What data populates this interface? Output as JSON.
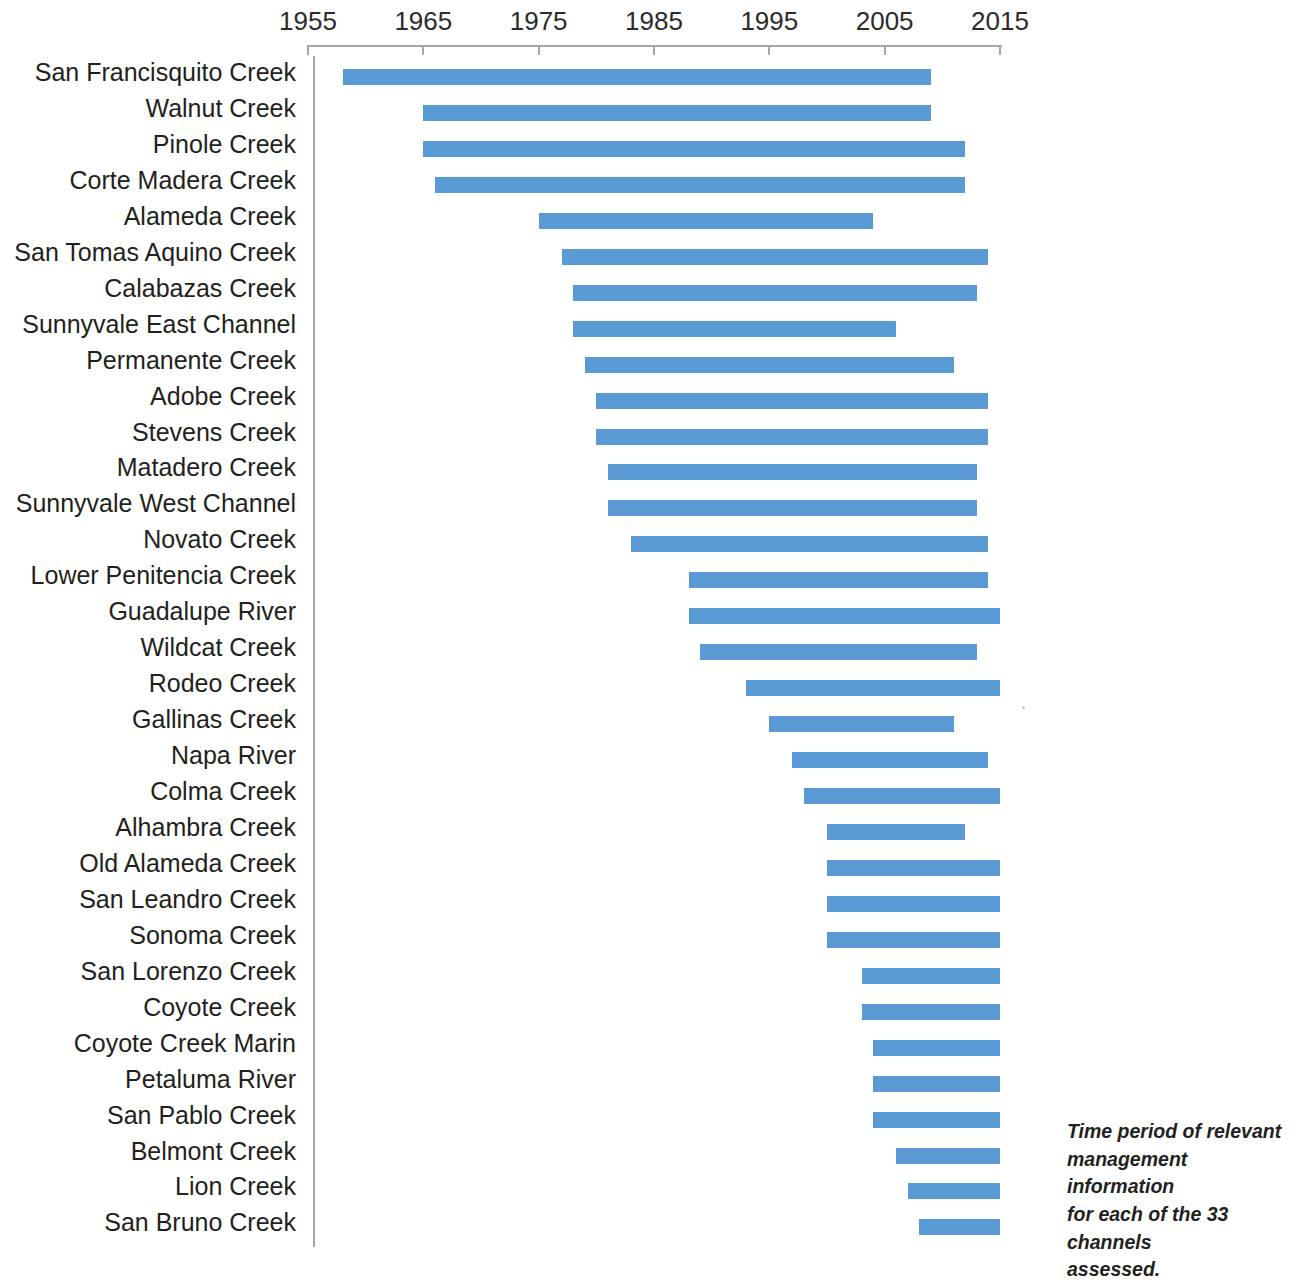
{
  "chart_data": {
    "type": "bar",
    "orientation": "horizontal",
    "subtype": "gantt-range",
    "title": "",
    "xlabel": "",
    "ylabel": "",
    "xlim": [
      1953,
      2016
    ],
    "grid": false,
    "legend": false,
    "bar_color": "#5b9bd5",
    "axis_ticks": [
      1955,
      1965,
      1975,
      1985,
      1995,
      2005,
      2015
    ],
    "tick_labels": [
      "1955",
      "1965",
      "1975",
      "1985",
      "1995",
      "2005",
      "2015"
    ],
    "categories": [
      "San Francisquito Creek",
      "Walnut Creek",
      "Pinole Creek",
      "Corte Madera Creek",
      "Alameda Creek",
      "San Tomas Aquino Creek",
      "Calabazas Creek",
      "Sunnyvale East Channel",
      "Permanente Creek",
      "Adobe Creek",
      "Stevens Creek",
      "Matadero Creek",
      "Sunnyvale West Channel",
      "Novato Creek",
      "Lower Penitencia Creek",
      "Guadalupe River",
      "Wildcat Creek",
      "Rodeo Creek",
      "Gallinas Creek",
      "Napa River",
      "Colma Creek",
      "Alhambra Creek",
      "Old Alameda Creek",
      "San Leandro Creek",
      "Sonoma Creek",
      "San Lorenzo Creek",
      "Coyote Creek",
      "Coyote Creek Marin",
      "Petaluma River",
      "San Pablo Creek",
      "Belmont Creek",
      "Lion Creek",
      "San Bruno Creek"
    ],
    "ranges": [
      [
        1958,
        2009
      ],
      [
        1965,
        2009
      ],
      [
        1965,
        2012
      ],
      [
        1966,
        2012
      ],
      [
        1975,
        2004
      ],
      [
        1977,
        2014
      ],
      [
        1978,
        2013
      ],
      [
        1978,
        2006
      ],
      [
        1979,
        2011
      ],
      [
        1980,
        2014
      ],
      [
        1980,
        2014
      ],
      [
        1981,
        2013
      ],
      [
        1981,
        2013
      ],
      [
        1983,
        2014
      ],
      [
        1988,
        2014
      ],
      [
        1988,
        2015
      ],
      [
        1989,
        2013
      ],
      [
        1993,
        2015
      ],
      [
        1995,
        2011
      ],
      [
        1997,
        2014
      ],
      [
        1998,
        2015
      ],
      [
        2000,
        2012
      ],
      [
        2000,
        2015
      ],
      [
        2000,
        2015
      ],
      [
        2000,
        2015
      ],
      [
        2003,
        2015
      ],
      [
        2003,
        2015
      ],
      [
        2004,
        2015
      ],
      [
        2004,
        2015
      ],
      [
        2004,
        2015
      ],
      [
        2006,
        2015
      ],
      [
        2007,
        2015
      ],
      [
        2008,
        2015
      ]
    ]
  },
  "caption": {
    "lines": [
      "Time period of relevant",
      "management information",
      "for each of the 33 channels",
      "assessed."
    ]
  }
}
